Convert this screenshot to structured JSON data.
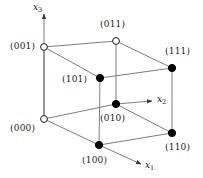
{
  "figure": {
    "type": "cube-vertex-diagram",
    "title": "",
    "background_color": "#ffffff",
    "line_color": "#6e6e6e",
    "text_color": "#1a1a1a",
    "filled_vertex_color": "#000000",
    "open_vertex_fill": "#ffffff",
    "width": 203,
    "height": 178
  },
  "axes": [
    {
      "name": "x3-axis",
      "label": "x",
      "subscript": "3",
      "label_x": 33,
      "label_y": 2,
      "from": {
        "x": 44,
        "y": 119
      },
      "to": {
        "x": 44,
        "y": 14
      }
    },
    {
      "name": "x2-axis",
      "label": "x",
      "subscript": "2",
      "label_x": 157,
      "label_y": 94,
      "from": {
        "x": 116,
        "y": 104
      },
      "to": {
        "x": 152,
        "y": 101
      }
    },
    {
      "name": "x1-axis",
      "label": "x",
      "subscript": "1",
      "label_x": 145,
      "label_y": 160,
      "from": {
        "x": 99,
        "y": 145
      },
      "to": {
        "x": 141,
        "y": 164
      }
    }
  ],
  "vertices": [
    {
      "id": "001",
      "label": "(001)",
      "x": 44,
      "y": 47,
      "filled": false,
      "label_x": 10,
      "label_y": 41
    },
    {
      "id": "011",
      "label": "(011)",
      "x": 116,
      "y": 41,
      "filled": false,
      "label_x": 100,
      "label_y": 19
    },
    {
      "id": "111",
      "label": "(111)",
      "x": 172,
      "y": 68,
      "filled": true,
      "label_x": 165,
      "label_y": 46
    },
    {
      "id": "101",
      "label": "(101)",
      "x": 100,
      "y": 78,
      "filled": true,
      "label_x": 62,
      "label_y": 74
    },
    {
      "id": "000",
      "label": "(000)",
      "x": 44,
      "y": 119,
      "filled": false,
      "label_x": 10,
      "label_y": 123
    },
    {
      "id": "010",
      "label": "(010)",
      "x": 116,
      "y": 104,
      "filled": true,
      "label_x": 100,
      "label_y": 113
    },
    {
      "id": "110",
      "label": "(110)",
      "x": 172,
      "y": 133,
      "filled": true,
      "label_x": 165,
      "label_y": 142
    },
    {
      "id": "100",
      "label": "(100)",
      "x": 99,
      "y": 145,
      "filled": true,
      "label_x": 82,
      "label_y": 155
    }
  ],
  "edges": [
    {
      "name": "edge-001-011",
      "from": "001",
      "to": "011"
    },
    {
      "name": "edge-011-111",
      "from": "011",
      "to": "111"
    },
    {
      "name": "edge-001-101",
      "from": "001",
      "to": "101"
    },
    {
      "name": "edge-101-111",
      "from": "101",
      "to": "111"
    },
    {
      "name": "edge-001-000",
      "from": "001",
      "to": "000"
    },
    {
      "name": "edge-011-010",
      "from": "011",
      "to": "010"
    },
    {
      "name": "edge-111-110",
      "from": "111",
      "to": "110"
    },
    {
      "name": "edge-101-100",
      "from": "101",
      "to": "100"
    },
    {
      "name": "edge-000-010",
      "from": "000",
      "to": "010"
    },
    {
      "name": "edge-010-110",
      "from": "010",
      "to": "110"
    },
    {
      "name": "edge-000-100",
      "from": "000",
      "to": "100"
    },
    {
      "name": "edge-100-110",
      "from": "100",
      "to": "110"
    }
  ]
}
